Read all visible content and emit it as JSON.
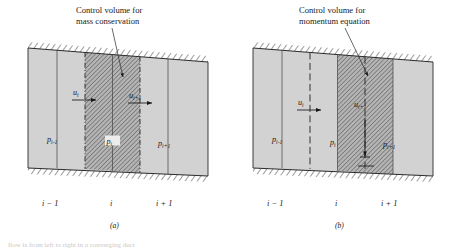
{
  "figure": {
    "caption_a": "(a)",
    "caption_b": "(b)",
    "bottom_bleed": "flow is from left to right in a converging duct"
  },
  "panel_a": {
    "annotation_line1": "Control volume for",
    "annotation_line2": "mass conservation",
    "velocity_labels": [
      {
        "base": "u",
        "sub": "i"
      },
      {
        "base": "u",
        "sub": "i+1"
      }
    ],
    "pressure_labels": [
      {
        "base": "p",
        "sub": "i-1"
      },
      {
        "base": "p",
        "sub": "i"
      },
      {
        "base": "p",
        "sub": "i+1"
      }
    ],
    "index_labels": [
      "i − 1",
      "i",
      "i + 1"
    ]
  },
  "panel_b": {
    "annotation_line1": "Control volume for",
    "annotation_line2": "momentum equation",
    "velocity_labels": [
      {
        "base": "u",
        "sub": "i"
      },
      {
        "base": "u",
        "sub": "i+1"
      }
    ],
    "pressure_labels": [
      {
        "base": "p",
        "sub": "i-1"
      },
      {
        "base": "p",
        "sub": "i"
      },
      {
        "base": "p",
        "sub": "i+1"
      }
    ],
    "index_labels": [
      "i − 1",
      "i",
      "i + 1"
    ]
  },
  "colors": {
    "duct_fill": "#d2d2d2",
    "cv_fill": "#b4b4b4",
    "outline": "#2b2b2b",
    "text": "#1a1a1a"
  }
}
